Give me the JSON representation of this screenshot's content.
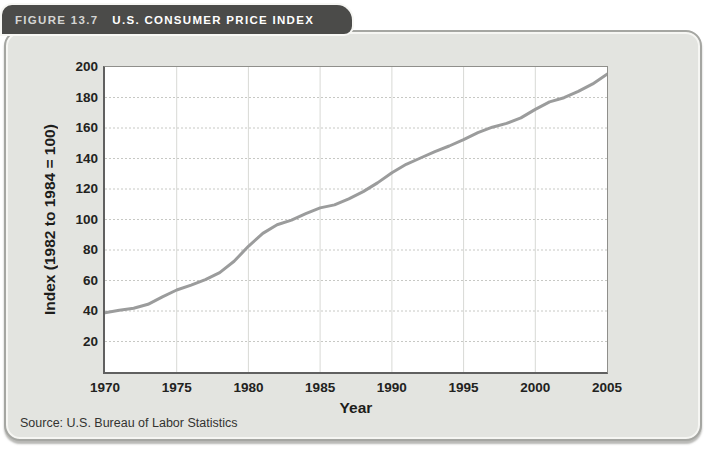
{
  "figure": {
    "label": "FIGURE 13.7",
    "title": "U.S. CONSUMER PRICE INDEX"
  },
  "source": "Source: U.S. Bureau of Labor Statistics",
  "colors": {
    "tab_background": "#4b4b49",
    "card_background": "#e3e4e0",
    "plot_background": "#ffffff",
    "line_color": "#9b9c9c",
    "h_grid_color": "#c7c8c4",
    "v_grid_color": "#d8d9d5"
  },
  "chart_data": {
    "type": "line",
    "title": "U.S. Consumer Price Index",
    "xlabel": "Year",
    "ylabel": "Index (1982 to 1984 = 100)",
    "xlim": [
      1970,
      2005
    ],
    "ylim": [
      0,
      200
    ],
    "x_ticks": [
      1970,
      1975,
      1980,
      1985,
      1990,
      1995,
      2000,
      2005
    ],
    "y_ticks": [
      20,
      40,
      60,
      80,
      100,
      120,
      140,
      160,
      180,
      200
    ],
    "grid": true,
    "legend": "none",
    "x": [
      1970,
      1971,
      1972,
      1973,
      1974,
      1975,
      1976,
      1977,
      1978,
      1979,
      1980,
      1981,
      1982,
      1983,
      1984,
      1985,
      1986,
      1987,
      1988,
      1989,
      1990,
      1991,
      1992,
      1993,
      1994,
      1995,
      1996,
      1997,
      1998,
      1999,
      2000,
      2001,
      2002,
      2003,
      2004,
      2005
    ],
    "values": [
      38.8,
      40.5,
      41.8,
      44.4,
      49.3,
      53.8,
      56.9,
      60.6,
      65.2,
      72.6,
      82.4,
      90.9,
      96.5,
      99.6,
      103.9,
      107.6,
      109.6,
      113.6,
      118.3,
      124.0,
      130.7,
      136.2,
      140.3,
      144.5,
      148.2,
      152.4,
      156.9,
      160.5,
      163.0,
      166.6,
      172.2,
      177.1,
      179.9,
      184.0,
      188.9,
      195.3
    ]
  }
}
